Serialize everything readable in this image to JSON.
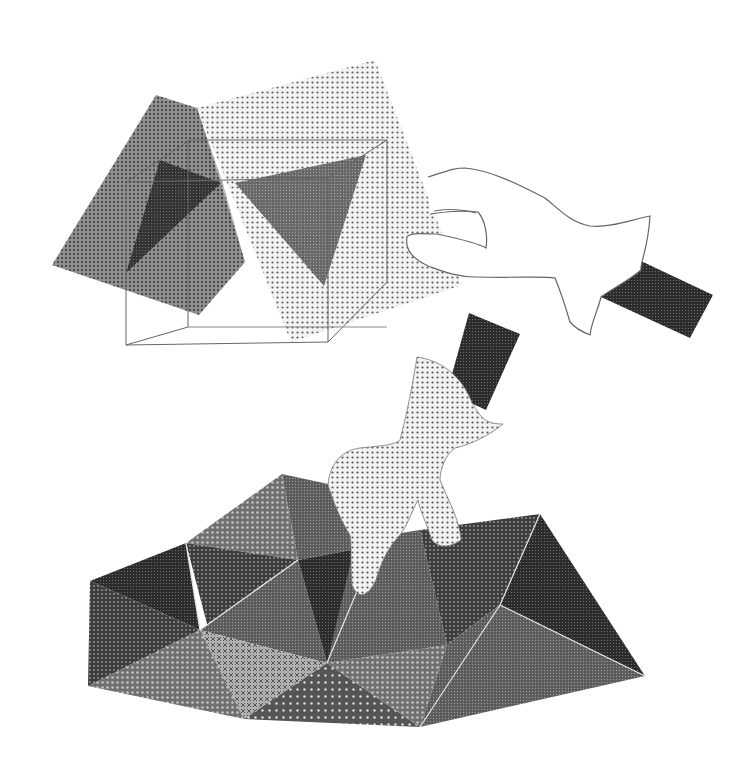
{
  "illustration": {
    "description": "Halftone illustration: hands manipulating translucent planes over a wireframe cube, and a hand pressing into a faceted polyhedral surface",
    "colors": {
      "background": "#ffffff",
      "ink": "#222222",
      "line": "#666666",
      "light_dot": "#555555",
      "highlight_edge": "#e6e6e6"
    },
    "elements": {
      "dark_plane": "dark halftone square plane",
      "light_plane": "light dotted square plane",
      "wire_cube": "wireframe cube outline",
      "left_triangle": "dark triangular intersection",
      "right_triangle": "mid-gray triangular intersection",
      "outline_hand": "outlined hand gripping light plane",
      "top_handle": "dark rectangular handle (upper right)",
      "dotted_hand": "dotted hand pressing surface",
      "bottom_handle": "dark rectangular handle (middle)",
      "faceted_surface": "triangulated polyhedral surface"
    }
  }
}
